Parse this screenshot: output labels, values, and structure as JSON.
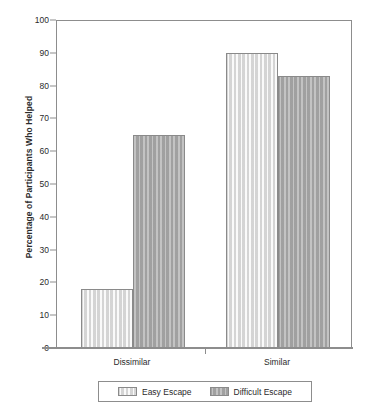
{
  "chart_data": {
    "type": "bar",
    "title": "",
    "xlabel": "",
    "ylabel": "Percentage of Participants Who Helped",
    "categories": [
      "Dissimilar",
      "Similar"
    ],
    "series": [
      {
        "name": "Easy Escape",
        "values": [
          18,
          90
        ],
        "color": "#dedede"
      },
      {
        "name": "Difficult Escape",
        "values": [
          65,
          83
        ],
        "color": "#a9a9a9"
      }
    ],
    "ylim": [
      0,
      100
    ],
    "ytick_step": 10,
    "yticks": [
      0,
      10,
      20,
      30,
      40,
      50,
      60,
      70,
      80,
      90,
      100
    ],
    "ytick_labels": [
      "0",
      "10",
      "20",
      "30",
      "40",
      "50",
      "60",
      "70",
      "80",
      "90",
      "100"
    ],
    "grid": false,
    "legend_position": "bottom-center",
    "legend_entries": [
      "Easy Escape",
      "Difficult Escape"
    ]
  },
  "axis": {
    "y_title": "Percentage of Participants Who Helped",
    "x_categories": [
      {
        "label": "Dissimilar"
      },
      {
        "label": "Similar"
      }
    ]
  },
  "legend": {
    "items": [
      {
        "label": "Easy Escape"
      },
      {
        "label": "Difficult Escape"
      }
    ]
  },
  "colors": {
    "bar_light": "#dedede",
    "bar_dark": "#a9a9a9",
    "axis": "#8d8d8d",
    "text": "#2b2b2b",
    "background": "#ffffff"
  }
}
